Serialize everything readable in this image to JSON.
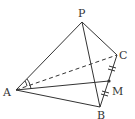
{
  "figure": {
    "type": "tetrahedron",
    "vertices": [
      {
        "name": "P",
        "label": "P",
        "x": 82,
        "y": 22
      },
      {
        "name": "A",
        "label": "A",
        "x": 16,
        "y": 90
      },
      {
        "name": "B",
        "label": "B",
        "x": 100,
        "y": 107
      },
      {
        "name": "C",
        "label": "C",
        "x": 117,
        "y": 55
      },
      {
        "name": "M",
        "label": "M",
        "x": 109,
        "y": 81
      }
    ],
    "solid_edges": [
      "PA",
      "PB",
      "PC",
      "AB",
      "BC",
      "AM"
    ],
    "dashed_edges": [
      "AC"
    ],
    "annotations": {
      "midpoint": "M is midpoint of BC (equal tick marks on CM and MB)",
      "angle_marks": "equal angles at A: angle PAC and angle CAM marked"
    },
    "colors": {
      "line": "#333333",
      "background": "#ffffff"
    }
  }
}
